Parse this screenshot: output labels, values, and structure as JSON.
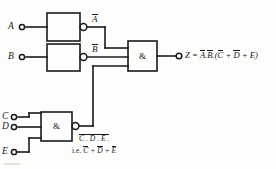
{
  "diagram": {
    "line_color": "#1a1a1a",
    "background": "#fdfdfc"
  },
  "inputs": [
    {
      "name": "input-a",
      "label": "A"
    },
    {
      "name": "input-b",
      "label": "B"
    },
    {
      "name": "input-c",
      "label": "C"
    },
    {
      "name": "input-d",
      "label": "D"
    },
    {
      "name": "input-e",
      "label": "E"
    }
  ],
  "gates": {
    "not_a": {
      "symbol": "",
      "output_label_base": "A",
      "output_overbar": true
    },
    "not_b": {
      "symbol": "",
      "output_label_base": "B",
      "output_overbar": true
    },
    "and_main": {
      "symbol": "&"
    },
    "nand_cde": {
      "symbol": "&"
    }
  },
  "wire_labels": {
    "a_bar": "A",
    "b_bar": "B"
  },
  "output": {
    "prefix": "Z = ",
    "terms": [
      {
        "text": "A",
        "bar": true
      },
      {
        "text": ".",
        "bar": false
      },
      {
        "text": "B",
        "bar": true
      },
      {
        "text": ".(",
        "bar": false
      },
      {
        "text": "C",
        "bar": true
      },
      {
        "text": " + ",
        "bar": false
      },
      {
        "text": "D",
        "bar": true
      },
      {
        "text": " + ",
        "bar": false
      },
      {
        "text": "E",
        "bar": false
      },
      {
        "text": ")",
        "bar": false
      }
    ],
    "full_text": "Z = A.B.(C + D + E)"
  },
  "annotation": {
    "line1_text": "C . D . E .",
    "line1_overbar": true,
    "line2_prefix": "i.e. ",
    "line2_terms": [
      {
        "text": "C",
        "bar": true
      },
      {
        "text": " + ",
        "bar": false
      },
      {
        "text": "D",
        "bar": true
      },
      {
        "text": " + ",
        "bar": false
      },
      {
        "text": "E",
        "bar": true
      }
    ],
    "line2_full": "i.e. C + D + E"
  }
}
